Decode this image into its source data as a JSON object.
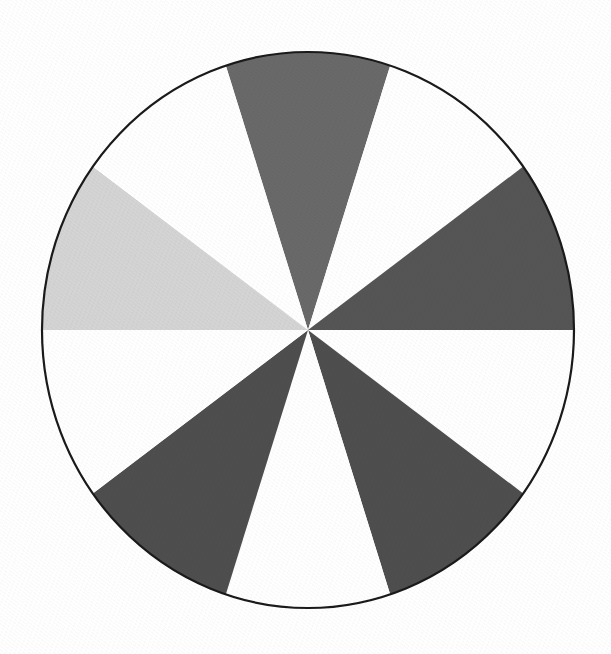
{
  "figure": {
    "kind": "pie-wheel",
    "background_color": "#FFFFFF",
    "outline_color": "#1A1A1A",
    "outline_width_px": 2.2,
    "center_x": 308,
    "center_y": 330,
    "radius_x": 266,
    "radius_y": 278,
    "sector_count": 10,
    "sector_angle_deg": 36,
    "start_offset_deg": -18,
    "alt_title": "Circle divided into ten equal sectors, alternating gray and white"
  },
  "chart_data": {
    "type": "pie",
    "title": "",
    "xlabel": "",
    "ylabel": "",
    "grid": false,
    "legend_position": "none",
    "total_slices": 10,
    "each_slice_angle_deg": 36,
    "each_slice_percent": 10,
    "start_angle_deg": -18,
    "direction": "clockwise",
    "categories": [
      "Sector 1",
      "Sector 2",
      "Sector 3",
      "Sector 4",
      "Sector 5",
      "Sector 6",
      "Sector 7",
      "Sector 8",
      "Sector 9",
      "Sector 10"
    ],
    "values": [
      10,
      10,
      10,
      10,
      10,
      10,
      10,
      10,
      10,
      10
    ],
    "colors": [
      "#696969",
      "#FFFFFF",
      "#555555",
      "#FFFFFF",
      "#4E4E4E",
      "#FFFFFF",
      "#4E4E4E",
      "#FFFFFF",
      "#D4D4D4",
      "#FFFFFF"
    ],
    "slices": [
      {
        "index": 1,
        "label": "Sector 1",
        "value": 10,
        "start_deg": -18,
        "end_deg": 18,
        "color": "#696969",
        "shade": "medium-gray",
        "clock_position": "12 o'clock"
      },
      {
        "index": 2,
        "label": "Sector 2",
        "value": 10,
        "start_deg": 18,
        "end_deg": 54,
        "color": "#FFFFFF",
        "shade": "white",
        "clock_position": "1 o'clock"
      },
      {
        "index": 3,
        "label": "Sector 3",
        "value": 10,
        "start_deg": 54,
        "end_deg": 90,
        "color": "#555555",
        "shade": "dark-gray",
        "clock_position": "2-3 o'clock"
      },
      {
        "index": 4,
        "label": "Sector 4",
        "value": 10,
        "start_deg": 90,
        "end_deg": 126,
        "color": "#FFFFFF",
        "shade": "white",
        "clock_position": "4 o'clock"
      },
      {
        "index": 5,
        "label": "Sector 5",
        "value": 10,
        "start_deg": 126,
        "end_deg": 162,
        "color": "#4E4E4E",
        "shade": "dark-gray",
        "clock_position": "5 o'clock"
      },
      {
        "index": 6,
        "label": "Sector 6",
        "value": 10,
        "start_deg": 162,
        "end_deg": 198,
        "color": "#FFFFFF",
        "shade": "white",
        "clock_position": "6 o'clock"
      },
      {
        "index": 7,
        "label": "Sector 7",
        "value": 10,
        "start_deg": 198,
        "end_deg": 234,
        "color": "#4E4E4E",
        "shade": "dark-gray",
        "clock_position": "7 o'clock"
      },
      {
        "index": 8,
        "label": "Sector 8",
        "value": 10,
        "start_deg": 234,
        "end_deg": 270,
        "color": "#FFFFFF",
        "shade": "white",
        "clock_position": "8 o'clock"
      },
      {
        "index": 9,
        "label": "Sector 9",
        "value": 10,
        "start_deg": 270,
        "end_deg": 306,
        "color": "#D4D4D4",
        "shade": "light-gray",
        "clock_position": "9 o'clock"
      },
      {
        "index": 10,
        "label": "Sector 10",
        "value": 10,
        "start_deg": 306,
        "end_deg": 342,
        "color": "#FFFFFF",
        "shade": "white",
        "clock_position": "10-11 o'clock"
      }
    ],
    "annotations": []
  }
}
